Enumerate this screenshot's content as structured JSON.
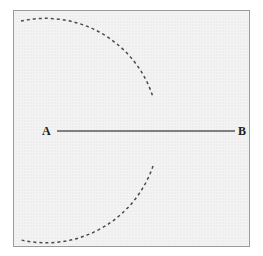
{
  "figure": {
    "type": "geometry-diagram",
    "background_color": "#f2f2f2",
    "frame": {
      "border_color": "#9a9a9a",
      "x": 13,
      "y": 10,
      "width": 237,
      "height": 237
    },
    "points": [
      {
        "name": "A",
        "label": "A",
        "x": 48,
        "y": 131
      },
      {
        "name": "B",
        "label": "B",
        "x": 240,
        "y": 131
      }
    ],
    "segment": {
      "name": "segment-ab",
      "from": "A",
      "to": "B",
      "x1": 57,
      "y1": 131,
      "x2": 235,
      "y2": 131,
      "stroke_color": "#5a5a5a",
      "stroke_width": 1.6,
      "style": "solid"
    },
    "arcs": [
      {
        "name": "upper-dashed-arc",
        "style": "dashed",
        "stroke_color": "#4a4a4a",
        "stroke_width": 1.5,
        "dash_pattern": "3 3",
        "center_x": 50,
        "center_y": 131,
        "radius": 113,
        "start_x": 21,
        "start_y": 21,
        "end_x": 153,
        "end_y": 97
      },
      {
        "name": "lower-dashed-arc",
        "style": "dashed",
        "stroke_color": "#4a4a4a",
        "stroke_width": 1.5,
        "dash_pattern": "3 3",
        "center_x": 50,
        "center_y": 131,
        "radius": 113,
        "start_x": 153,
        "start_y": 166,
        "end_x": 21,
        "end_y": 240
      }
    ]
  }
}
